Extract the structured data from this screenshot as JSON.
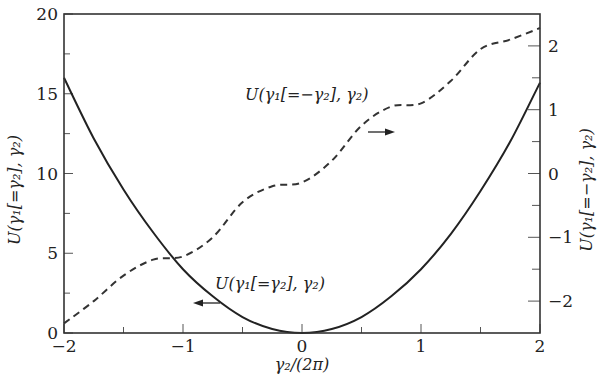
{
  "chart_data": {
    "type": "line",
    "title": "",
    "xlabel": "γ₂/(2π)",
    "ylabel_left": "U(γ₁[=γ₂], γ₂)",
    "ylabel_right": "U(γ₁[=−γ₂], γ₂)",
    "xlim": [
      -2,
      2
    ],
    "ylim_left": [
      0,
      20
    ],
    "ylim_right": [
      -2.5,
      2.5
    ],
    "x_ticks": [
      -2,
      -1,
      0,
      1,
      2
    ],
    "x_tick_labels": [
      "−2",
      "−1",
      "0",
      "1",
      "2"
    ],
    "y_left_ticks": [
      0,
      5,
      10,
      15,
      20
    ],
    "y_left_tick_labels": [
      "0",
      "5",
      "10",
      "15",
      "20"
    ],
    "y_right_ticks": [
      -2,
      -1,
      0,
      1,
      2
    ],
    "y_right_tick_labels": [
      "−2",
      "−1",
      "0",
      "1",
      "2"
    ],
    "grid": false,
    "series": [
      {
        "name": "U(γ₁[=γ₂], γ₂)",
        "axis": "left",
        "style": "solid",
        "x": [
          -2,
          -1.75,
          -1.5,
          -1.25,
          -1,
          -0.75,
          -0.5,
          -0.25,
          0,
          0.25,
          0.5,
          0.75,
          1,
          1.25,
          1.5,
          1.75,
          2
        ],
        "y": [
          16.0,
          12.2,
          9.0,
          6.3,
          4.0,
          2.3,
          1.0,
          0.25,
          0,
          0.25,
          1.0,
          2.3,
          4.0,
          6.2,
          8.9,
          12.0,
          15.7
        ]
      },
      {
        "name": "U(γ₁[=−γ₂], γ₂)",
        "axis": "right",
        "style": "dashed",
        "x": [
          -2,
          -1.75,
          -1.5,
          -1.25,
          -1,
          -0.75,
          -0.5,
          -0.25,
          0,
          0.25,
          0.5,
          0.75,
          1,
          1.25,
          1.5,
          1.75,
          2
        ],
        "y": [
          -2.35,
          -2.0,
          -1.6,
          -1.35,
          -1.3,
          -1.0,
          -0.45,
          -0.2,
          -0.14,
          0.2,
          0.75,
          1.05,
          1.1,
          1.45,
          1.95,
          2.1,
          2.28
        ]
      }
    ],
    "annotations": [
      {
        "text": "U(γ₁[=−γ₂], γ₂)",
        "arrow": "right",
        "points_to": "right axis"
      },
      {
        "text": "U(γ₁[=γ₂], γ₂)",
        "arrow": "left",
        "points_to": "left axis"
      }
    ]
  },
  "labels": {
    "xlabel": "γ₂/(2π)",
    "ylabel_left": "U(γ₁[=γ₂], γ₂)",
    "ylabel_right": "U(γ₁[=−γ₂], γ₂)",
    "annot_dashed": "U(γ₁[=−γ₂], γ₂)",
    "annot_solid": "U(γ₁[=γ₂], γ₂)"
  }
}
